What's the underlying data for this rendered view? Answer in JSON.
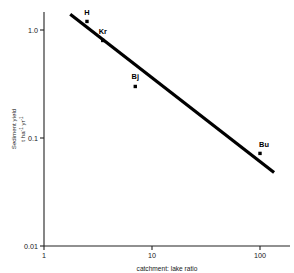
{
  "chart_data": {
    "type": "scatter",
    "title": "",
    "subtitle": "",
    "xlabel": "catchment: lake ratio",
    "ylabel": "Sediment yield",
    "ylabel_units": "t ha",
    "ylabel_units_exp1": "-1",
    "ylabel_units_mid": " yr",
    "ylabel_units_exp2": "-1",
    "xscale": "log",
    "yscale": "log",
    "xlim": [
      1,
      150
    ],
    "ylim": [
      0.01,
      2.0
    ],
    "grid": false,
    "legend": "none",
    "frame": "left-and-bottom-only",
    "xticks": [
      "1",
      "10",
      "100"
    ],
    "xtick_values": [
      1,
      10,
      100
    ],
    "yticks": [
      "1.0",
      "0.1",
      "0.01"
    ],
    "ytick_values": [
      1.0,
      0.1,
      0.01
    ],
    "points": [
      {
        "label": "H",
        "x": 2.5,
        "y": 1.2,
        "label_dx": 0,
        "label_dy": -6
      },
      {
        "label": "Kr",
        "x": 3.5,
        "y": 0.8,
        "label_dx": 0,
        "label_dy": -6
      },
      {
        "label": "Bj",
        "x": 7.0,
        "y": 0.3,
        "label_dx": 0,
        "label_dy": -7
      },
      {
        "label": "Bu",
        "x": 100.0,
        "y": 0.072,
        "label_dx": 4,
        "label_dy": -6
      }
    ],
    "series": [
      {
        "name": "regression line",
        "type": "line",
        "x": [
          1.75,
          135
        ],
        "y": [
          1.4,
          0.048
        ]
      }
    ],
    "colors": {
      "line": "#000000",
      "marker": "#000000",
      "axis": "#222222",
      "text": "#1a1a1a",
      "background": "#ffffff"
    }
  }
}
